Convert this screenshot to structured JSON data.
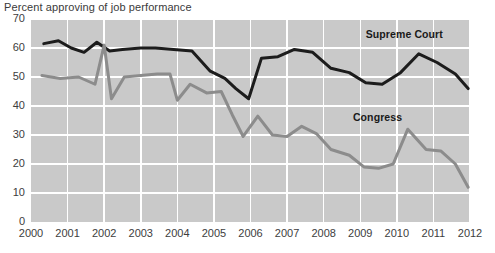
{
  "chart_data": {
    "type": "line",
    "title": "Percent approving of job performance",
    "xlabel": "",
    "ylabel": "",
    "xlim": [
      2000,
      2012
    ],
    "ylim": [
      0,
      70
    ],
    "ytick_values": [
      0,
      10,
      20,
      30,
      40,
      50,
      60,
      70
    ],
    "ytick_labels": [
      "0",
      "10",
      "20",
      "30",
      "40",
      "50",
      "60",
      "70"
    ],
    "xtick_values": [
      2000,
      2001,
      2002,
      2003,
      2004,
      2005,
      2006,
      2007,
      2008,
      2009,
      2010,
      2011,
      2012
    ],
    "xtick_labels": [
      "2000",
      "2001",
      "2002",
      "2003",
      "2004",
      "2005",
      "2006",
      "2007",
      "2008",
      "2009",
      "2010",
      "2011",
      "2012"
    ],
    "grid": true,
    "legend_position": "inline-annotation",
    "plot_background": "#c9c9c9",
    "series": [
      {
        "name": "Supreme Court",
        "color": "#1c1c1c",
        "label_x": 2009.15,
        "label_y": 64.5,
        "x": [
          2000.35,
          2000.75,
          2001.1,
          2001.45,
          2001.8,
          2002.15,
          2002.5,
          2003.0,
          2003.4,
          2003.9,
          2004.4,
          2004.9,
          2005.3,
          2005.6,
          2005.95,
          2006.3,
          2006.75,
          2007.2,
          2007.7,
          2008.2,
          2008.7,
          2009.15,
          2009.6,
          2010.1,
          2010.6,
          2011.1,
          2011.6,
          2011.95
        ],
        "y": [
          61.5,
          62.5,
          60.0,
          58.5,
          62.0,
          59.0,
          59.5,
          60.0,
          60.0,
          59.5,
          59.0,
          52.0,
          49.5,
          46.0,
          42.5,
          56.5,
          57.0,
          59.5,
          58.5,
          53.0,
          51.5,
          48.0,
          47.5,
          51.5,
          58.0,
          55.0,
          51.0,
          46.0
        ]
      },
      {
        "name": "Congress",
        "color": "#8c8c8c",
        "label_x": 2008.8,
        "label_y": 36.0,
        "x": [
          2000.3,
          2000.8,
          2001.3,
          2001.75,
          2002.0,
          2002.2,
          2002.55,
          2003.0,
          2003.45,
          2003.8,
          2004.0,
          2004.35,
          2004.8,
          2005.2,
          2005.5,
          2005.8,
          2006.2,
          2006.6,
          2007.0,
          2007.4,
          2007.8,
          2008.2,
          2008.7,
          2009.1,
          2009.5,
          2009.9,
          2010.3,
          2010.8,
          2011.2,
          2011.6,
          2011.95
        ],
        "y": [
          50.5,
          49.5,
          50.0,
          47.5,
          61.0,
          42.5,
          50.0,
          50.5,
          51.0,
          51.0,
          42.0,
          47.5,
          44.5,
          45.0,
          37.0,
          29.5,
          36.5,
          30.0,
          29.5,
          33.0,
          30.5,
          25.0,
          23.0,
          19.0,
          18.5,
          20.0,
          32.0,
          25.0,
          24.5,
          20.0,
          12.0
        ]
      }
    ]
  }
}
